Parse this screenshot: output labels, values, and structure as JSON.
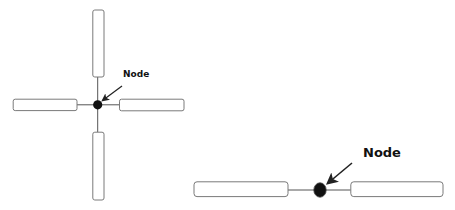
{
  "figures": [
    {
      "name": "cross-junction",
      "node_label": "Node",
      "node_label_font_size": 9,
      "node": {
        "cx": 97.7,
        "cy": 104.8,
        "r": 4.6
      },
      "arms": [
        {
          "name": "top",
          "x": 92.8,
          "y": 10,
          "w": 11.2,
          "h": 67
        },
        {
          "name": "left",
          "x": 13.2,
          "y": 99.2,
          "w": 63.8,
          "h": 11.4
        },
        {
          "name": "right",
          "x": 119.5,
          "y": 99.2,
          "w": 64.5,
          "h": 11.6
        },
        {
          "name": "bottom",
          "x": 92.8,
          "y": 132.2,
          "w": 11.2,
          "h": 67.8
        }
      ],
      "label_pos": {
        "x": 123,
        "y": 77
      },
      "arrow": {
        "x1": 122,
        "y1": 86,
        "x2": 102.5,
        "y2": 100.5
      }
    },
    {
      "name": "linear-junction",
      "node_label": "Node",
      "node_label_font_size": 13,
      "node": {
        "cx": 320,
        "cy": 190,
        "rx": 6.2,
        "ry": 7.2
      },
      "arms": [
        {
          "name": "left",
          "x": 194,
          "y": 181.8,
          "w": 94,
          "h": 14.8
        },
        {
          "name": "right",
          "x": 350.8,
          "y": 181.8,
          "w": 92.2,
          "h": 14.8
        }
      ],
      "label_pos": {
        "x": 363,
        "y": 157
      },
      "arrow": {
        "x1": 352,
        "y1": 163,
        "x2": 327.5,
        "y2": 183.5
      }
    }
  ],
  "colors": {
    "stroke": "#7a7a7a",
    "line": "#555555",
    "node": "#111111",
    "arrow": "#222222",
    "text": "#111111"
  }
}
